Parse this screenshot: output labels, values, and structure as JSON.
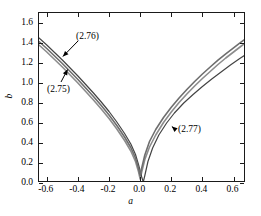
{
  "chart_data": {
    "type": "line",
    "title": "",
    "xlabel": "a",
    "ylabel": "b",
    "xlim": [
      -0.65,
      0.68
    ],
    "ylim": [
      0.0,
      1.7
    ],
    "grid": false,
    "legend": null,
    "xticks": [
      "-0.6",
      "-0.4",
      "-0.2",
      "0.0",
      "0.2",
      "0.4",
      "0.6"
    ],
    "xtick_values": [
      -0.6,
      -0.4,
      -0.2,
      0.0,
      0.2,
      0.4,
      0.6
    ],
    "yticks": [
      "0.0",
      "0.2",
      "0.4",
      "0.6",
      "0.8",
      "1.0",
      "1.2",
      "1.4",
      "1.6"
    ],
    "ytick_values": [
      0.0,
      0.2,
      0.4,
      0.6,
      0.8,
      1.0,
      1.2,
      1.4,
      1.6
    ],
    "series": [
      {
        "name": "(2.75)",
        "color": "#8c8c8c",
        "linewidth": 1.6,
        "x": [
          -0.65,
          -0.6,
          -0.55,
          -0.5,
          -0.45,
          -0.4,
          -0.35,
          -0.3,
          -0.25,
          -0.2,
          -0.15,
          -0.1,
          -0.06,
          -0.03,
          -0.01,
          0.0,
          0.01,
          0.03,
          0.06,
          0.1,
          0.15,
          0.2,
          0.25,
          0.3,
          0.35,
          0.4,
          0.45,
          0.5,
          0.55,
          0.6,
          0.65,
          0.68
        ],
        "y": [
          1.38,
          1.31,
          1.235,
          1.16,
          1.08,
          1.0,
          0.915,
          0.83,
          0.74,
          0.645,
          0.54,
          0.425,
          0.32,
          0.215,
          0.11,
          0.04,
          0.11,
          0.235,
          0.36,
          0.48,
          0.605,
          0.71,
          0.805,
          0.89,
          0.97,
          1.045,
          1.115,
          1.185,
          1.25,
          1.31,
          1.37,
          1.405
        ]
      },
      {
        "name": "(2.76)",
        "color": "#444444",
        "linewidth": 1.2,
        "x": [
          -0.65,
          -0.6,
          -0.55,
          -0.5,
          -0.45,
          -0.4,
          -0.35,
          -0.3,
          -0.25,
          -0.2,
          -0.15,
          -0.1,
          -0.06,
          -0.03,
          -0.01,
          0.01,
          0.02,
          0.03,
          0.05,
          0.08,
          0.12,
          0.17,
          0.22,
          0.28,
          0.34,
          0.4,
          0.46,
          0.52,
          0.58,
          0.64,
          0.68
        ],
        "y": [
          1.45,
          1.38,
          1.305,
          1.23,
          1.15,
          1.07,
          0.985,
          0.9,
          0.81,
          0.715,
          0.61,
          0.495,
          0.39,
          0.285,
          0.18,
          0.06,
          0.01,
          0.075,
          0.215,
          0.35,
          0.48,
          0.6,
          0.7,
          0.8,
          0.885,
          0.965,
          1.04,
          1.11,
          1.18,
          1.245,
          1.285
        ]
      },
      {
        "name": "(2.77)",
        "color": "#6e6e6e",
        "linewidth": 1.6,
        "x": [
          -0.65,
          -0.6,
          -0.55,
          -0.5,
          -0.45,
          -0.4,
          -0.35,
          -0.3,
          -0.25,
          -0.2,
          -0.15,
          -0.1,
          -0.06,
          -0.03,
          -0.01,
          0.0,
          0.01,
          0.03,
          0.06,
          0.1,
          0.15,
          0.2,
          0.25,
          0.3,
          0.35,
          0.4,
          0.45,
          0.5,
          0.55,
          0.6,
          0.65,
          0.68
        ],
        "y": [
          1.415,
          1.345,
          1.27,
          1.195,
          1.115,
          1.035,
          0.95,
          0.865,
          0.775,
          0.68,
          0.575,
          0.46,
          0.355,
          0.25,
          0.145,
          0.075,
          0.15,
          0.28,
          0.415,
          0.535,
          0.655,
          0.758,
          0.85,
          0.935,
          1.015,
          1.09,
          1.16,
          1.228,
          1.292,
          1.352,
          1.412,
          1.445
        ]
      }
    ],
    "annotations": [
      {
        "label": "(2.76)",
        "target_x": -0.49,
        "target_y": 1.255
      },
      {
        "label": "(2.75)",
        "target_x": -0.46,
        "target_y": 1.125
      },
      {
        "label": "(2.77)",
        "target_x": 0.21,
        "target_y": 0.555
      }
    ]
  },
  "axes": {
    "xlabel": "a",
    "ylabel": "b"
  }
}
